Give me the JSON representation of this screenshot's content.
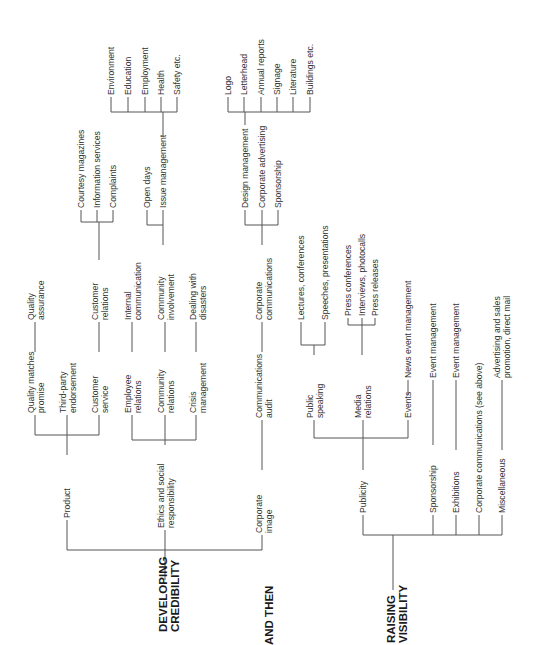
{
  "roots": {
    "developing_credibility": [
      "DEVELOPING",
      "CREDIBILITY"
    ],
    "and_then": [
      "AND THEN"
    ],
    "raising_visibility": [
      "RAISING",
      "VISIBILITY"
    ]
  },
  "credibility": {
    "product": {
      "label": [
        "Product"
      ],
      "children": {
        "quality_matches_promise": [
          "Quality matches",
          "promise"
        ],
        "quality_assurance": [
          "Quality",
          "assurance"
        ],
        "third_party_endorsement": [
          "Third-party",
          "endorsement"
        ],
        "customer_service": [
          "Customer",
          "service"
        ],
        "customer_relations": [
          "Customer",
          "relations"
        ],
        "courtesy_magazines": [
          "Courtesy magazines"
        ],
        "information_services": [
          "Information services"
        ],
        "complaints": [
          "Complaints"
        ]
      }
    },
    "ethics": {
      "label": [
        "Ethics and social",
        "responsibility"
      ],
      "children": {
        "employee_relations": [
          "Employee",
          "relations"
        ],
        "internal_communication": [
          "Internal",
          "communication"
        ],
        "community_relations": [
          "Community",
          "relations"
        ],
        "community_involvement": [
          "Community",
          "involvement"
        ],
        "open_days": [
          "Open days"
        ],
        "issue_management": [
          "Issue management"
        ],
        "environment": [
          "Environment"
        ],
        "education": [
          "Education"
        ],
        "employment": [
          "Employment"
        ],
        "health": [
          "Health"
        ],
        "safety": [
          "Safety etc."
        ],
        "crisis_management": [
          "Crisis",
          "management"
        ],
        "dealing_with_disasters": [
          "Dealing with",
          "disasters"
        ]
      }
    },
    "corporate_image": {
      "label": [
        "Corporate",
        "image"
      ],
      "children": {
        "communications_audit": [
          "Communications",
          "audit"
        ],
        "corporate_communications": [
          "Corporate",
          "communications"
        ],
        "design_management": [
          "Design management"
        ],
        "corporate_advertising": [
          "Corporate advertising"
        ],
        "sponsorship": [
          "Sponsorship"
        ],
        "logo": [
          "Logo"
        ],
        "letterhead": [
          "Letterhead"
        ],
        "annual_reports": [
          "Annual reports"
        ],
        "signage": [
          "Signage"
        ],
        "literature": [
          "Literature"
        ],
        "buildings": [
          "Buildings etc."
        ]
      }
    }
  },
  "visibility": {
    "publicity": {
      "label": [
        "Publicity"
      ],
      "children": {
        "public_speaking": [
          "Public",
          "speaking"
        ],
        "lectures_conferences": [
          "Lectures, conferences"
        ],
        "speeches_presentations": [
          "Speeches, presentations"
        ],
        "media_relations": [
          "Media",
          "relations"
        ],
        "press_conferences": [
          "Press conferences"
        ],
        "interviews_photocalls": [
          "Interviews, photocalls"
        ],
        "press_releases": [
          "Press releases"
        ],
        "events": [
          "Events"
        ],
        "news_event_management": [
          "News event management"
        ]
      }
    },
    "sponsorship": {
      "label": [
        "Sponsorship"
      ],
      "child": [
        "Event management"
      ]
    },
    "exhibitions": {
      "label": [
        "Exhibitions"
      ],
      "child": [
        "Event management"
      ]
    },
    "corporate_communications": {
      "label": [
        "Corporate communications (see above)"
      ]
    },
    "miscellaneous": {
      "label": [
        "Miscellaneous"
      ],
      "child": [
        "Advertising and sales",
        "promotion, direct mail"
      ]
    }
  }
}
